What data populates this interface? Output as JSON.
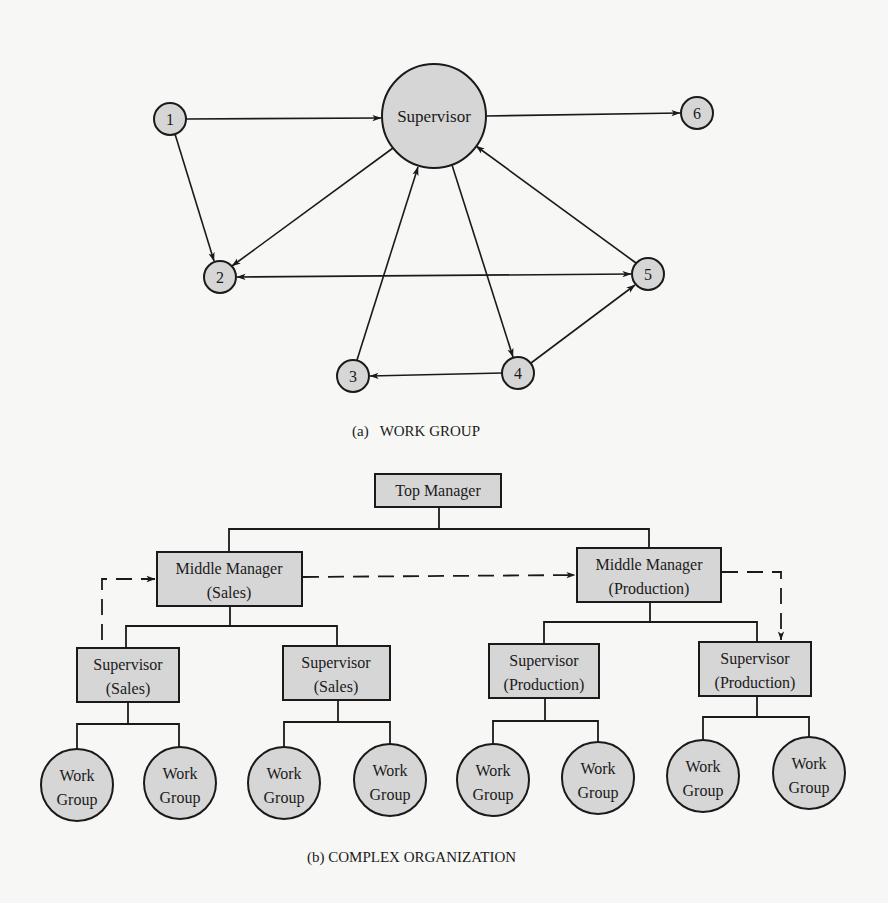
{
  "work_group": {
    "caption": "(a)   WORK GROUP",
    "supervisor": {
      "label": "Supervisor",
      "cx": 434,
      "cy": 116,
      "r": 52
    },
    "nodes": [
      {
        "id": "1",
        "label": "1",
        "cx": 170,
        "cy": 119,
        "r": 16
      },
      {
        "id": "2",
        "label": "2",
        "cx": 220,
        "cy": 277,
        "r": 16
      },
      {
        "id": "3",
        "label": "3",
        "cx": 353,
        "cy": 376,
        "r": 16
      },
      {
        "id": "4",
        "label": "4",
        "cx": 518,
        "cy": 373,
        "r": 16
      },
      {
        "id": "5",
        "label": "5",
        "cx": 648,
        "cy": 274,
        "r": 16
      },
      {
        "id": "6",
        "label": "6",
        "cx": 697,
        "cy": 113,
        "r": 16
      }
    ],
    "edges": [
      {
        "from": "1",
        "to": "Supervisor"
      },
      {
        "from": "Supervisor",
        "to": "6"
      },
      {
        "from": "1",
        "to": "2"
      },
      {
        "from": "Supervisor",
        "to": "2"
      },
      {
        "from": "2",
        "to": "5",
        "bidirectional": true
      },
      {
        "from": "3",
        "to": "Supervisor"
      },
      {
        "from": "Supervisor",
        "to": "4"
      },
      {
        "from": "5",
        "to": "Supervisor"
      },
      {
        "from": "4",
        "to": "3"
      },
      {
        "from": "4",
        "to": "5"
      }
    ]
  },
  "complex_org": {
    "caption": "(b) COMPLEX ORGANIZATION",
    "top_manager": {
      "label": "Top Manager"
    },
    "middle_managers": [
      {
        "line1": "Middle Manager",
        "line2": "(Sales)"
      },
      {
        "line1": "Middle Manager",
        "line2": "(Production)"
      }
    ],
    "supervisors": [
      {
        "line1": "Supervisor",
        "line2": "(Sales)"
      },
      {
        "line1": "Supervisor",
        "line2": "(Sales)"
      },
      {
        "line1": "Supervisor",
        "line2": "(Production)"
      },
      {
        "line1": "Supervisor",
        "line2": "(Production)"
      }
    ],
    "work_groups": [
      {
        "line1": "Work",
        "line2": "Group"
      },
      {
        "line1": "Work",
        "line2": "Group"
      },
      {
        "line1": "Work",
        "line2": "Group"
      },
      {
        "line1": "Work",
        "line2": "Group"
      },
      {
        "line1": "Work",
        "line2": "Group"
      },
      {
        "line1": "Work",
        "line2": "Group"
      },
      {
        "line1": "Work",
        "line2": "Group"
      },
      {
        "line1": "Work",
        "line2": "Group"
      }
    ],
    "dashed_links": [
      {
        "from": "Supervisor (Sales) 1",
        "to": "Middle Manager (Sales)"
      },
      {
        "from": "Middle Manager (Sales)",
        "to": "Middle Manager (Production)"
      },
      {
        "from": "Middle Manager (Production)",
        "to": "Supervisor (Production) 2"
      }
    ]
  },
  "colors": {
    "node_fill": "#d6d6d6",
    "stroke": "#1a1a1a",
    "background": "#f7f7f5"
  }
}
